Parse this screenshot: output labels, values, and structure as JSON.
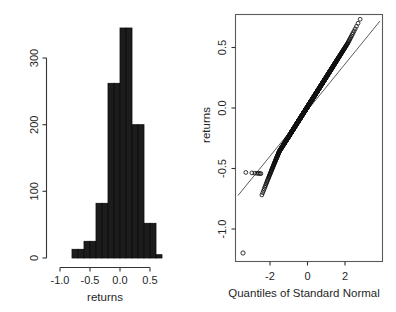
{
  "figure": {
    "width": 396,
    "height": 312,
    "background": "#ffffff",
    "panels": [
      "histogram",
      "qqplot"
    ]
  },
  "chart_data": [
    {
      "type": "bar",
      "subtype": "histogram",
      "title": "",
      "xlabel": "returns",
      "ylabel": "",
      "xlim": [
        -1.05,
        0.75
      ],
      "ylim": [
        0,
        360
      ],
      "grid": false,
      "legend": null,
      "bin_width": 0.1,
      "bin_edges": [
        -0.8,
        -0.7,
        -0.6,
        -0.5,
        -0.4,
        -0.3,
        -0.2,
        -0.1,
        0.0,
        0.1,
        0.2,
        0.3,
        0.4,
        0.5,
        0.6,
        0.7
      ],
      "categories": [
        "-0.75",
        "-0.65",
        "-0.55",
        "-0.45",
        "-0.35",
        "-0.25",
        "-0.15",
        "-0.05",
        "0.05",
        "0.15",
        "0.25",
        "0.35",
        "0.45",
        "0.55",
        "0.65"
      ],
      "values": [
        13,
        13,
        25,
        25,
        82,
        82,
        262,
        262,
        345,
        345,
        200,
        200,
        52,
        52,
        5
      ],
      "bars": [
        {
          "x0": -0.8,
          "x1": -0.7,
          "count": 13
        },
        {
          "x0": -0.7,
          "x1": -0.6,
          "count": 13
        },
        {
          "x0": -0.6,
          "x1": -0.5,
          "count": 25
        },
        {
          "x0": -0.5,
          "x1": -0.4,
          "count": 25
        },
        {
          "x0": -0.4,
          "x1": -0.3,
          "count": 82
        },
        {
          "x0": -0.3,
          "x1": -0.2,
          "count": 82
        },
        {
          "x0": -0.2,
          "x1": -0.1,
          "count": 262
        },
        {
          "x0": -0.1,
          "x1": 0.0,
          "count": 262
        },
        {
          "x0": 0.0,
          "x1": 0.1,
          "count": 345
        },
        {
          "x0": 0.1,
          "x1": 0.2,
          "count": 345
        },
        {
          "x0": 0.2,
          "x1": 0.3,
          "count": 200
        },
        {
          "x0": 0.3,
          "x1": 0.4,
          "count": 200
        },
        {
          "x0": 0.4,
          "x1": 0.5,
          "count": 52
        },
        {
          "x0": 0.5,
          "x1": 0.6,
          "count": 52
        },
        {
          "x0": 0.6,
          "x1": 0.7,
          "count": 5
        }
      ],
      "xticks": [
        -1.0,
        -0.5,
        0.0,
        0.5
      ],
      "xticklabels": [
        "-1.0",
        "-0.5",
        "0.0",
        "0.5"
      ],
      "yticks": [
        0,
        100,
        200,
        300
      ],
      "yticklabels": [
        "0",
        "100",
        "200",
        "300"
      ]
    },
    {
      "type": "scatter",
      "subtype": "qq-plot",
      "title": "",
      "xlabel": "Quantiles of Standard Normal",
      "ylabel": "returns",
      "xlim": [
        -3.6,
        3.6
      ],
      "ylim": [
        -1.22,
        0.82
      ],
      "grid": false,
      "legend": null,
      "frame": true,
      "reference_line": {
        "intercept": 0.01,
        "slope": 0.245
      },
      "xticks": [
        -2,
        0,
        2
      ],
      "xticklabels": [
        "-2",
        "0",
        "2"
      ],
      "yticks": [
        -1.0,
        -0.5,
        0.0,
        0.5
      ],
      "yticklabels": [
        "-1.0",
        "-0.5",
        "0.0",
        "0.5"
      ]
    }
  ],
  "histogram_panel": {
    "name": "histogram",
    "xlabel": "returns",
    "yticklabels": [
      "0",
      "100",
      "200",
      "300"
    ],
    "xticklabels": [
      "-1.0",
      "-0.5",
      "0.0",
      "0.5"
    ]
  },
  "qq_panel": {
    "name": "qqplot",
    "xlabel": "Quantiles of Standard Normal",
    "ylabel": "returns",
    "yticklabels": [
      "-1.0",
      "-0.5",
      "0.0",
      "0.5"
    ],
    "xticklabels": [
      "-2",
      "0",
      "2"
    ]
  },
  "colors": {
    "bar_fill": "#1c1c1c",
    "axis": "#333333",
    "frame": "#5b5b5b",
    "point": "#111111",
    "background": "#ffffff"
  }
}
